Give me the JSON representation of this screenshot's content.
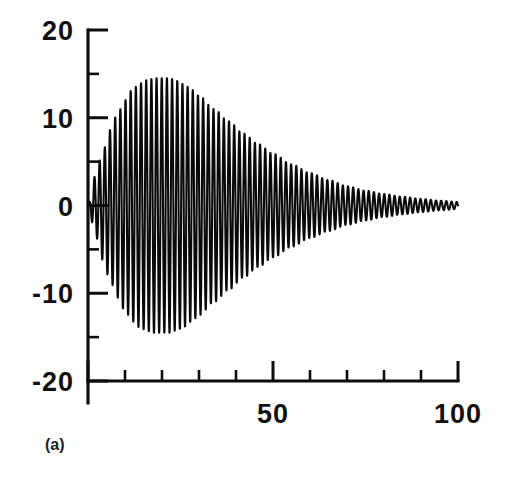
{
  "figure": {
    "panel_label": "(a)",
    "background_color": "#ffffff",
    "ink_color": "#0d0d0d"
  },
  "chart_data": {
    "type": "line",
    "title": "",
    "subtitle": "",
    "xlabel": "",
    "ylabel": "",
    "xlim": [
      0,
      100
    ],
    "ylim": [
      -20,
      20
    ],
    "grid": false,
    "legend": null,
    "legend_position": "none",
    "annotations": [
      "(a)"
    ],
    "x_ticks_major": [
      0,
      50,
      100
    ],
    "x_ticks_minor": [
      10,
      20,
      30,
      40,
      60,
      70,
      80,
      90
    ],
    "x_tick_labels": [
      "50",
      "100"
    ],
    "x_tick_label_values": [
      50,
      100
    ],
    "y_ticks_major": [
      -20,
      -10,
      0,
      10,
      20
    ],
    "y_ticks_minor": [
      -15,
      -5,
      5,
      15
    ],
    "y_tick_labels": [
      "20",
      "10",
      "0",
      "-10",
      "-20"
    ],
    "y_tick_label_values": [
      20,
      10,
      0,
      -10,
      -20
    ],
    "series": [
      {
        "name": "damped oscillation",
        "description": "Transient oscillatory response: amplitude grows from 0, peaks near x=22 at about 14.5, then decays toward 0 by x=100",
        "envelope_peak_value": 14.5,
        "envelope_peak_x": 22,
        "envelope_min_value": -14.8,
        "oscillation_period": 1.4,
        "oscillation_frequency": 0.715,
        "envelope_rise_rate": 0.16,
        "envelope_decay_rate": 0.062,
        "phase": 0,
        "x_start": 0,
        "x_end": 100,
        "envelope_x": [
          0,
          2,
          4,
          6,
          8,
          10,
          12,
          14,
          16,
          18,
          20,
          22,
          24,
          26,
          28,
          30,
          34,
          38,
          42,
          46,
          50,
          55,
          60,
          65,
          70,
          75,
          80,
          85,
          90,
          95,
          100
        ],
        "envelope_y": [
          0.0,
          3.4,
          6.2,
          8.6,
          10.5,
          12.0,
          13.2,
          13.9,
          14.3,
          14.5,
          14.5,
          14.5,
          14.2,
          13.8,
          13.2,
          12.5,
          11.0,
          9.6,
          8.2,
          7.0,
          5.9,
          4.7,
          3.7,
          2.9,
          2.2,
          1.7,
          1.3,
          1.0,
          0.75,
          0.55,
          0.4
        ]
      }
    ]
  }
}
